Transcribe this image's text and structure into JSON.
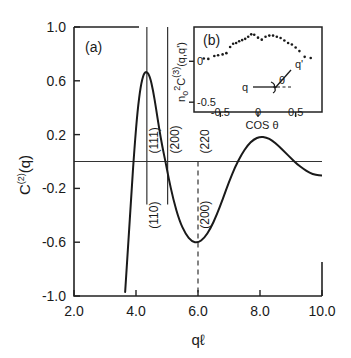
{
  "figure": {
    "panel_a_label": "(a)",
    "panel_b_label": "(b)"
  },
  "chart_data": [
    {
      "id": "main",
      "type": "line",
      "title": "",
      "xlabel": "qℓ",
      "ylabel": "C⁽²⁾(q)",
      "ylabel_parts": {
        "base": "C",
        "superscript": "(2)",
        "arg": "(q)"
      },
      "xlim": [
        2.0,
        10.0
      ],
      "ylim": [
        -1.0,
        1.0
      ],
      "xticks": [
        2.0,
        4.0,
        6.0,
        8.0,
        10.0
      ],
      "xtick_labels": [
        "2.0",
        "4.0",
        "6.0",
        "8.0",
        "10.0"
      ],
      "yticks": [
        1.0,
        0.6,
        0.2,
        -0.2,
        -0.6,
        -1.0
      ],
      "ytick_labels": [
        "1.0",
        "0.6",
        "0.2",
        "-0.2",
        "-0.6",
        "-1.0"
      ],
      "grid": false,
      "legend": "none",
      "zero_line": 0.0,
      "series": [
        {
          "name": "C2(q)",
          "x": [
            3.65,
            3.75,
            3.85,
            3.95,
            4.05,
            4.15,
            4.25,
            4.35,
            4.45,
            4.55,
            4.65,
            4.75,
            4.85,
            4.95,
            5.05,
            5.2,
            5.4,
            5.6,
            5.8,
            6.0,
            6.2,
            6.4,
            6.6,
            6.8,
            7.0,
            7.2,
            7.4,
            7.6,
            7.8,
            8.0,
            8.2,
            8.4,
            8.6,
            8.8,
            9.0,
            9.2,
            9.4,
            9.6,
            9.8,
            10.0
          ],
          "y": [
            -0.97,
            -0.62,
            -0.24,
            0.1,
            0.38,
            0.56,
            0.655,
            0.67,
            0.63,
            0.53,
            0.39,
            0.24,
            0.11,
            0.0,
            -0.12,
            -0.28,
            -0.44,
            -0.54,
            -0.595,
            -0.605,
            -0.57,
            -0.5,
            -0.4,
            -0.28,
            -0.15,
            -0.04,
            0.05,
            0.12,
            0.165,
            0.185,
            0.18,
            0.155,
            0.115,
            0.07,
            0.025,
            -0.02,
            -0.055,
            -0.085,
            -0.1,
            -0.105
          ]
        }
      ],
      "vertical_markers": [
        {
          "x": 4.35,
          "style": "solid",
          "label_above": "(111)",
          "label_below": "(110)"
        },
        {
          "x": 5.02,
          "style": "solid",
          "label_above": "(200)",
          "label_below": ""
        },
        {
          "x": 6.0,
          "style": "dashed",
          "label_above": "(220)",
          "label_below": "(200)"
        }
      ]
    },
    {
      "id": "inset",
      "type": "scatter",
      "title": "",
      "xlabel": "COS θ",
      "ylabel": "nₒ²C⁽³⁾(q,q')",
      "ylabel_parts": {
        "n": "n",
        "n_sub": "o",
        "n_sup": "2",
        "c": "C",
        "c_sup": "(3)",
        "arg": "(q,q')"
      },
      "xlim": [
        -0.85,
        0.85
      ],
      "ylim": [
        -0.62,
        0.42
      ],
      "xticks": [
        -0.5,
        0,
        0.5
      ],
      "xtick_labels": [
        "-0.5",
        "0",
        "0.5"
      ],
      "yticks": [
        0,
        -0.5
      ],
      "ytick_labels": [
        "0",
        "-0.5"
      ],
      "grid": false,
      "legend": "none",
      "points": [
        {
          "x": -0.72,
          "y": 0.035
        },
        {
          "x": -0.66,
          "y": 0.03
        },
        {
          "x": -0.58,
          "y": 0.065
        },
        {
          "x": -0.53,
          "y": 0.075
        },
        {
          "x": -0.47,
          "y": 0.085
        },
        {
          "x": -0.42,
          "y": 0.1
        },
        {
          "x": -0.37,
          "y": 0.175
        },
        {
          "x": -0.33,
          "y": 0.215
        },
        {
          "x": -0.29,
          "y": 0.225
        },
        {
          "x": -0.25,
          "y": 0.245
        },
        {
          "x": -0.21,
          "y": 0.26
        },
        {
          "x": -0.17,
          "y": 0.275
        },
        {
          "x": -0.13,
          "y": 0.3
        },
        {
          "x": -0.09,
          "y": 0.33
        },
        {
          "x": -0.05,
          "y": 0.325
        },
        {
          "x": 0.0,
          "y": 0.29
        },
        {
          "x": 0.05,
          "y": 0.265
        },
        {
          "x": 0.1,
          "y": 0.3
        },
        {
          "x": 0.15,
          "y": 0.315
        },
        {
          "x": 0.2,
          "y": 0.315
        },
        {
          "x": 0.25,
          "y": 0.3
        },
        {
          "x": 0.3,
          "y": 0.285
        },
        {
          "x": 0.35,
          "y": 0.255
        },
        {
          "x": 0.4,
          "y": 0.225
        },
        {
          "x": 0.45,
          "y": 0.205
        },
        {
          "x": 0.5,
          "y": 0.17
        },
        {
          "x": 0.55,
          "y": 0.125
        },
        {
          "x": 0.62,
          "y": 0.055
        },
        {
          "x": 0.7,
          "y": 0.04
        }
      ],
      "diagram": {
        "label_q": "q",
        "label_q_prime": "q'",
        "label_theta": "θ"
      }
    }
  ],
  "colors": {
    "ink": "#1a1a1a",
    "axis": "#222222",
    "background": "#ffffff"
  }
}
